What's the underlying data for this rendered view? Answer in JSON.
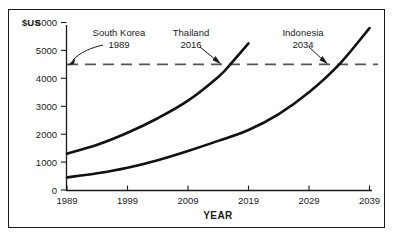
{
  "chart_data": {
    "type": "line",
    "title": "",
    "xlabel": "YEAR",
    "ylabel": "$US",
    "xlim": [
      1989,
      2039
    ],
    "ylim": [
      0,
      6000
    ],
    "grid": false,
    "legend": "none",
    "x_ticks": [
      "1989",
      "1999",
      "2009",
      "2019",
      "2029",
      "2039"
    ],
    "x_tick_values": [
      1989,
      1999,
      2009,
      2019,
      2029,
      2039
    ],
    "y_ticks": [
      "0",
      "1000",
      "2000",
      "3000",
      "4000",
      "5000",
      "6000"
    ],
    "y_tick_values": [
      0,
      1000,
      2000,
      3000,
      4000,
      5000,
      6000
    ],
    "series": [
      {
        "name": "Thailand",
        "x": [
          1989,
          1994,
          1999,
          2004,
          2009,
          2014,
          2016,
          2019
        ],
        "values": [
          1300,
          1620,
          2050,
          2570,
          3200,
          4050,
          4500,
          5250
        ]
      },
      {
        "name": "Indonesia",
        "x": [
          1989,
          1994,
          1999,
          2004,
          2009,
          2014,
          2019,
          2024,
          2029,
          2034,
          2039
        ],
        "values": [
          450,
          600,
          800,
          1070,
          1400,
          1760,
          2150,
          2720,
          3500,
          4500,
          5800
        ]
      }
    ],
    "reference_line": {
      "name": "South Korea 1989 income level",
      "value": 4500,
      "style": "dashed",
      "color": "#555555"
    },
    "annotations": [
      {
        "id": "south-korea",
        "country": "South Korea",
        "year": "1989",
        "target_x": 1989,
        "target_y": 4500
      },
      {
        "id": "thailand",
        "country": "Thailand",
        "year": "2016",
        "target_x": 2016,
        "target_y": 4500
      },
      {
        "id": "indonesia",
        "country": "Indonesia",
        "year": "2034",
        "target_x": 2034,
        "target_y": 4500
      }
    ]
  }
}
